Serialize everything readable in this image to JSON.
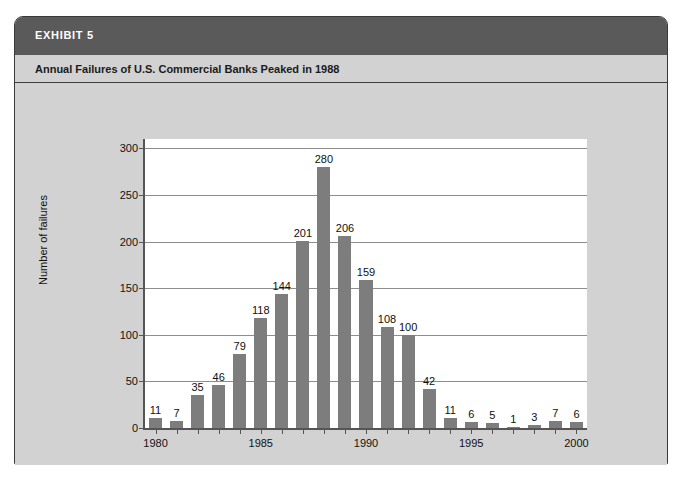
{
  "exhibit": {
    "label": "EXHIBIT 5",
    "subtitle": "Annual Failures of U.S. Commercial Banks Peaked in 1988",
    "header_color": "#5a5a5a",
    "panel_color": "#d2d2d2",
    "plot_color": "#ffffff",
    "bar_color": "#7d7d7d"
  },
  "chart_data": {
    "type": "bar",
    "title": "Annual Failures of U.S. Commercial Banks Peaked in 1988",
    "xlabel": "",
    "ylabel": "Number of failures",
    "categories": [
      "1980",
      "1981",
      "1982",
      "1983",
      "1984",
      "1985",
      "1986",
      "1987",
      "1988",
      "1989",
      "1990",
      "1991",
      "1992",
      "1993",
      "1994",
      "1995",
      "1996",
      "1997",
      "1998",
      "1999",
      "2000"
    ],
    "values": [
      11,
      7,
      35,
      46,
      79,
      118,
      144,
      201,
      280,
      206,
      159,
      108,
      100,
      42,
      11,
      6,
      5,
      1,
      3,
      7,
      6
    ],
    "data_labels": [
      "11",
      "7",
      "35",
      "46",
      "79",
      "118",
      "144",
      "201",
      "280",
      "206",
      "159",
      "108",
      "100",
      "42",
      "11",
      "6",
      "5",
      "1",
      "3",
      "7",
      "6"
    ],
    "ylim": [
      0,
      310
    ],
    "yticks": [
      0,
      50,
      100,
      150,
      200,
      250,
      300
    ],
    "ytick_labels": [
      "0",
      "50",
      "100",
      "150",
      "200",
      "250",
      "300"
    ],
    "xtick_labels": [
      "1980",
      "1985",
      "1990",
      "1995",
      "2000"
    ],
    "grid": true,
    "legend": null
  }
}
